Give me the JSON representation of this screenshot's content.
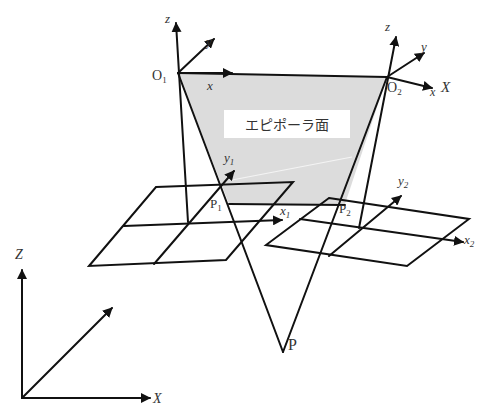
{
  "diagram": {
    "plane_label": "エピポーラ面",
    "camera1": {
      "origin_label": "O",
      "origin_sub": "1",
      "axis_x": "x",
      "axis_y": "y",
      "axis_z": "z",
      "image_point": "P",
      "image_point_sub": "1",
      "image_x": "x",
      "image_x_sub": "1",
      "image_y": "y",
      "image_y_sub": "1"
    },
    "camera2": {
      "origin_label": "O",
      "origin_sub": "2",
      "axis_x": "x",
      "axis_y": "y",
      "axis_z": "z",
      "baseline_label": "X",
      "image_point": "P",
      "image_point_sub": "2",
      "image_x": "x",
      "image_x_sub": "2",
      "image_y": "y",
      "image_y_sub": "2"
    },
    "world": {
      "axis_X": "X",
      "axis_Z": "Z"
    },
    "scene_point": "P",
    "colors": {
      "line": "#111111",
      "plane_fill": "#dcdcdc",
      "label_box": "#ffffff",
      "text": "#333333"
    }
  }
}
